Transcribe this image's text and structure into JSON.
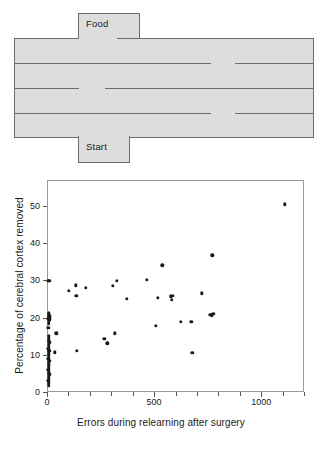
{
  "maze": {
    "food_label": "Food",
    "start_label": "Start",
    "fill_color": "#dddddd",
    "line_color": "#6d6d6d"
  },
  "chart_data": {
    "type": "scatter",
    "title": "",
    "xlabel": "Errors during relearning after surgery",
    "ylabel": "Percentage of cerebral cortex removed",
    "xlim": [
      0,
      1200
    ],
    "ylim": [
      0,
      57
    ],
    "xticks": [
      0,
      500,
      1000
    ],
    "xtick_labels": [
      "0",
      "500",
      "1000"
    ],
    "xminor_ticks": [
      100,
      200,
      300,
      400,
      600,
      700,
      800,
      900,
      1100,
      1200
    ],
    "yticks": [
      0,
      10,
      20,
      30,
      40,
      50
    ],
    "ytick_labels": [
      "0",
      "10",
      "20",
      "30",
      "40",
      "50"
    ],
    "grid": false,
    "legend": null,
    "marker_color": "#1a1a1a",
    "points": [
      [
        2,
        30.2
      ],
      [
        6,
        30.1
      ],
      [
        3,
        21.4
      ],
      [
        5,
        21.0
      ],
      [
        8,
        20.8
      ],
      [
        4,
        20.3
      ],
      [
        9,
        20.1
      ],
      [
        6,
        19.6
      ],
      [
        3,
        19.2
      ],
      [
        7,
        20.6
      ],
      [
        2,
        19.9
      ],
      [
        4,
        18.6
      ],
      [
        2,
        17.6
      ],
      [
        38,
        16.0
      ],
      [
        3,
        15.4
      ],
      [
        5,
        14.8
      ],
      [
        4,
        14.2
      ],
      [
        6,
        13.6
      ],
      [
        3,
        13.0
      ],
      [
        5,
        12.4
      ],
      [
        2,
        11.9
      ],
      [
        7,
        11.4
      ],
      [
        4,
        11.0
      ],
      [
        33,
        10.9
      ],
      [
        3,
        10.4
      ],
      [
        5,
        9.8
      ],
      [
        2,
        9.2
      ],
      [
        6,
        8.6
      ],
      [
        4,
        8.0
      ],
      [
        3,
        7.4
      ],
      [
        5,
        6.8
      ],
      [
        2,
        6.2
      ],
      [
        4,
        5.6
      ],
      [
        6,
        5.0
      ],
      [
        3,
        4.4
      ],
      [
        5,
        3.8
      ],
      [
        2,
        3.2
      ],
      [
        4,
        2.6
      ],
      [
        3,
        2.0
      ],
      [
        97,
        27.4
      ],
      [
        129,
        29.0
      ],
      [
        133,
        26.1
      ],
      [
        176,
        28.3
      ],
      [
        134,
        11.3
      ],
      [
        262,
        14.5
      ],
      [
        277,
        13.4
      ],
      [
        303,
        28.9
      ],
      [
        322,
        30.2
      ],
      [
        313,
        16.1
      ],
      [
        369,
        25.3
      ],
      [
        460,
        30.4
      ],
      [
        512,
        25.6
      ],
      [
        504,
        18.0
      ],
      [
        533,
        34.3
      ],
      [
        572,
        26.0
      ],
      [
        578,
        25.0
      ],
      [
        583,
        26.1
      ],
      [
        619,
        19.2
      ],
      [
        669,
        19.1
      ],
      [
        673,
        10.8
      ],
      [
        719,
        26.8
      ],
      [
        757,
        21.0
      ],
      [
        766,
        20.9
      ],
      [
        772,
        21.3
      ],
      [
        768,
        37.0
      ],
      [
        1106,
        50.7
      ]
    ]
  }
}
